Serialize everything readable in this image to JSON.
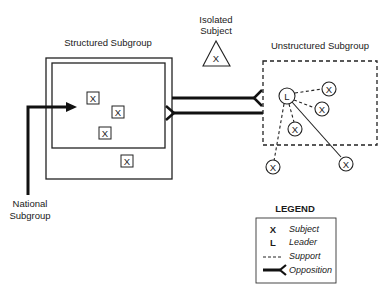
{
  "diagram": {
    "structured_subgroup": {
      "title": "Structured Subgroup",
      "subjects": [
        "X",
        "X",
        "X",
        "X"
      ]
    },
    "national_subgroup": {
      "label_line1": "National",
      "label_line2": "Subgroup"
    },
    "isolated_subject": {
      "label_line1": "Isolated",
      "label_line2": "Subject",
      "symbol": "X"
    },
    "unstructured_subgroup": {
      "title": "Unstructured Subgroup",
      "leader": "L",
      "subjects": [
        "X",
        "X",
        "X",
        "X",
        "X"
      ]
    },
    "legend": {
      "title": "LEGEND",
      "items": [
        {
          "symbol": "X",
          "label": "Subject"
        },
        {
          "symbol": "L",
          "label": "Leader"
        },
        {
          "symbol": "dashed-line",
          "label": "Support"
        },
        {
          "symbol": "fork-line",
          "label": "Opposition"
        }
      ]
    }
  }
}
